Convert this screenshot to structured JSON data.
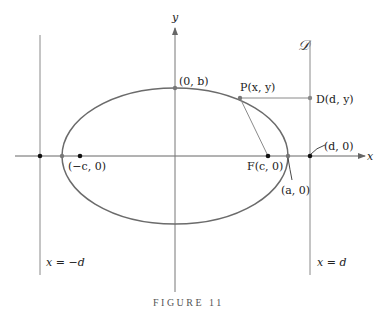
{
  "figure": {
    "caption": "FIGURE 11",
    "axes": {
      "x_label": "x",
      "y_label": "y"
    },
    "directrix_symbol": "𝒟",
    "labels": {
      "top_vertex": "(0, b)",
      "point_p": "P(x, y)",
      "point_d": "D(d, y)",
      "d_zero": "(d, 0)",
      "neg_c": "(−c, 0)",
      "focus": "F(c, 0)",
      "a_zero": "(a, 0)",
      "left_directrix": "x = −d",
      "right_directrix": "x = d"
    },
    "colors": {
      "ellipse": "#6b6b6b",
      "lines": "#8a8a8a",
      "points": "#111111"
    }
  }
}
